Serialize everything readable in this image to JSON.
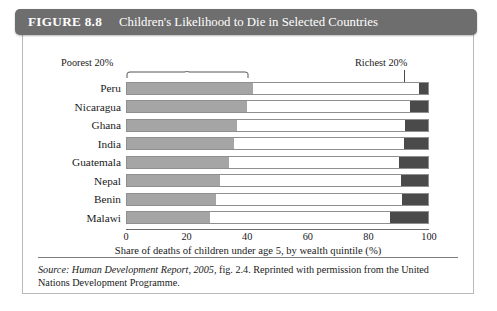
{
  "figure": {
    "label": "FIGURE 8.8",
    "title": "Children's Likelihood to Die in Selected Countries"
  },
  "annotations": {
    "poorest": "Poorest 20%",
    "richest": "Richest 20%"
  },
  "source": {
    "prefix": "Source:",
    "publication": "Human Development Report, 2005,",
    "rest": "fig. 2.4. Reprinted with permission from the United Nations Development Programme."
  },
  "colors": {
    "header_bg": "#6e6e6e",
    "poorest_quintile": "#a5a5a5",
    "middle_quintiles": "#ffffff",
    "richest_quintile": "#4a4a4a",
    "bar_border": "#8f8f8f"
  },
  "chart_data": {
    "type": "bar",
    "orientation": "horizontal",
    "stacked": true,
    "title": "Children's Likelihood to Die in Selected Countries",
    "xlabel": "Share of deaths of children under age 5, by wealth quintile (%)",
    "ylabel": "",
    "xlim": [
      0,
      100
    ],
    "xticks": [
      0,
      20,
      40,
      60,
      80,
      100
    ],
    "xtick_labels": [
      "0",
      "20",
      "40",
      "60",
      "80",
      "100"
    ],
    "grid": false,
    "legend": false,
    "categories": [
      "Peru",
      "Nicaragua",
      "Ghana",
      "India",
      "Guatemala",
      "Nepal",
      "Benin",
      "Malawi"
    ],
    "series": [
      {
        "name": "Poorest 20%",
        "color": "#a5a5a5",
        "values": [
          42.0,
          40.0,
          36.5,
          35.5,
          34.0,
          31.0,
          29.5,
          27.5
        ]
      },
      {
        "name": "Middle 60%",
        "color": "#ffffff",
        "values": [
          55.0,
          54.0,
          56.0,
          56.5,
          56.5,
          60.0,
          62.0,
          60.0
        ]
      },
      {
        "name": "Richest 20%",
        "color": "#4a4a4a",
        "values": [
          3.0,
          6.0,
          7.5,
          8.0,
          9.5,
          9.0,
          8.5,
          12.5
        ]
      }
    ],
    "annotations": [
      {
        "text": "Poorest 20%",
        "target": "left segment of Peru bar",
        "marker": "bracket"
      },
      {
        "text": "Richest 20%",
        "target": "right segment of Peru bar",
        "marker": "leader-line"
      }
    ]
  }
}
